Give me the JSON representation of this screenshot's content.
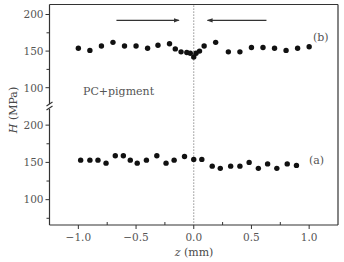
{
  "chart_data": {
    "type": "scatter",
    "title": "",
    "xlabel": "z (mm)",
    "xlabel_parts": {
      "symbol": "z",
      "unit": "(mm)"
    },
    "ylabel": "H (MPa)",
    "ylabel_parts": {
      "symbol": "H",
      "unit": "(MPa)"
    },
    "xlim": [
      -1.25,
      1.25
    ],
    "x_ticks": [
      -1.0,
      -0.5,
      0.0,
      0.5,
      1.0
    ],
    "x_tick_labels": [
      "−1.0",
      "−0.5",
      "0.0",
      "0.5",
      "1.0"
    ],
    "x_minor_ticks": [
      -0.75,
      -0.25,
      0.25,
      0.75
    ],
    "grid": false,
    "legend": null,
    "y_axis_break": true,
    "panels": [
      {
        "name": "upper",
        "ylim": [
          75,
          213
        ],
        "y_ticks": [
          100,
          150,
          200
        ],
        "y_tick_labels": [
          "100",
          "150",
          "200"
        ],
        "y_minor_ticks": [
          125,
          175
        ]
      },
      {
        "name": "lower",
        "ylim": [
          66,
          223
        ],
        "y_ticks": [
          100,
          150,
          200
        ],
        "y_tick_labels": [
          "100",
          "150",
          "200"
        ],
        "y_minor_ticks": [
          75,
          125,
          175
        ]
      }
    ],
    "series": [
      {
        "name": "(b)",
        "panel": "upper",
        "marker": "filled-circle",
        "color": "#111111",
        "points": [
          [
            -1.0,
            154
          ],
          [
            -0.9,
            151
          ],
          [
            -0.8,
            157
          ],
          [
            -0.7,
            162
          ],
          [
            -0.6,
            157
          ],
          [
            -0.5,
            157
          ],
          [
            -0.4,
            154
          ],
          [
            -0.31,
            158
          ],
          [
            -0.21,
            160
          ],
          [
            -0.16,
            153
          ],
          [
            -0.11,
            149
          ],
          [
            -0.06,
            148
          ],
          [
            -0.03,
            147
          ],
          [
            0.0,
            142
          ],
          [
            0.02,
            147
          ],
          [
            0.05,
            150
          ],
          [
            0.09,
            157
          ],
          [
            0.19,
            162
          ],
          [
            0.3,
            149
          ],
          [
            0.4,
            149
          ],
          [
            0.5,
            155
          ],
          [
            0.6,
            155
          ],
          [
            0.7,
            154
          ],
          [
            0.8,
            151
          ],
          [
            0.9,
            154
          ],
          [
            1.0,
            156
          ]
        ]
      },
      {
        "name": "(a)",
        "panel": "lower",
        "marker": "filled-circle",
        "color": "#111111",
        "points": [
          [
            -0.98,
            153
          ],
          [
            -0.9,
            153
          ],
          [
            -0.83,
            153
          ],
          [
            -0.76,
            149
          ],
          [
            -0.68,
            159
          ],
          [
            -0.61,
            159
          ],
          [
            -0.55,
            153
          ],
          [
            -0.49,
            149
          ],
          [
            -0.41,
            153
          ],
          [
            -0.32,
            159
          ],
          [
            -0.24,
            149
          ],
          [
            -0.17,
            153
          ],
          [
            -0.08,
            158
          ],
          [
            0.0,
            154
          ],
          [
            0.07,
            154
          ],
          [
            0.16,
            145
          ],
          [
            0.23,
            142
          ],
          [
            0.32,
            145
          ],
          [
            0.4,
            145
          ],
          [
            0.48,
            150
          ],
          [
            0.56,
            142
          ],
          [
            0.64,
            148
          ],
          [
            0.72,
            142
          ],
          [
            0.81,
            148
          ],
          [
            0.89,
            146
          ]
        ]
      }
    ],
    "annotations": {
      "sample_label": "PC+pigment",
      "series_b_label": "(b)",
      "series_a_label": "(a)",
      "vertical_reference_line": {
        "z": 0.0,
        "style": "dotted"
      },
      "arrows": [
        {
          "panel": "upper",
          "from_z": -0.67,
          "to_z": -0.13,
          "H": 192,
          "direction": "right"
        },
        {
          "panel": "upper",
          "from_z": 0.63,
          "to_z": 0.12,
          "H": 192,
          "direction": "left"
        }
      ]
    }
  }
}
